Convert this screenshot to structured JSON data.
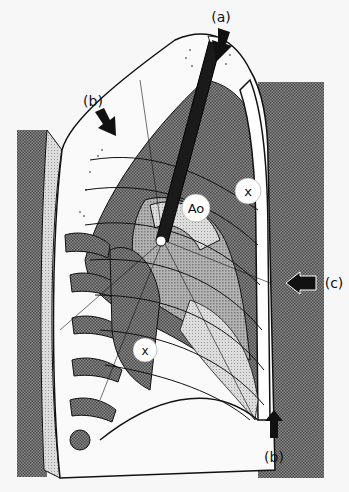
{
  "figure": {
    "type": "medical-illustration",
    "view": "lateral thorax cross-section with needle insertion"
  },
  "labels": {
    "a": "(a)",
    "b_top": "(b)",
    "b_bottom": "(b)",
    "c": "(c)",
    "ao": "Ao",
    "x_upper": "x",
    "x_lower": "x"
  },
  "colors": {
    "background": "#f7f7f7",
    "halftone_dark": "#6e6e6e",
    "halftone_mid": "#9a9a9a",
    "halftone_light": "#c9c9c9",
    "ink": "#111111",
    "white": "#ffffff"
  }
}
